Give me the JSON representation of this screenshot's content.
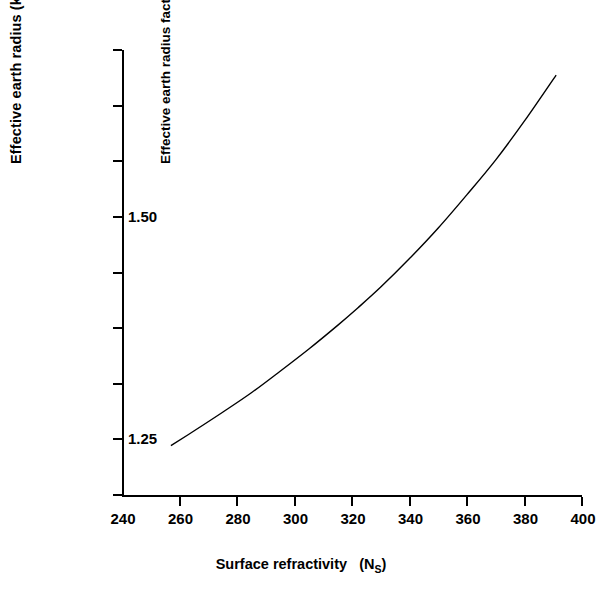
{
  "chart_data": {
    "type": "line",
    "title": "",
    "xlabel": "Surface refractivity  (N_S)",
    "xlabel_main": "Surface refractivity",
    "xlabel_paren_open": "(N",
    "xlabel_sub": "S",
    "xlabel_paren_close": ")",
    "ylabel": "Effective earth radius (km)",
    "ylabel_secondary": "Effective earth radius factor",
    "xlim": [
      240,
      400
    ],
    "ylim": [
      7600,
      10800
    ],
    "xticks": [
      240,
      260,
      280,
      300,
      320,
      340,
      360,
      380,
      400
    ],
    "xtick_labels": [
      "240",
      "260",
      "280",
      "300",
      "320",
      "340",
      "360",
      "380",
      "400"
    ],
    "yticks": [
      7600,
      8000,
      8400,
      8800,
      9200,
      9600,
      10000,
      10400,
      10800
    ],
    "ytick_labels": [
      "7600",
      "8000",
      "8400",
      "8800",
      "9200",
      "9600",
      "10000",
      "10400",
      "10800"
    ],
    "y2ticks": [
      8000,
      9600
    ],
    "y2tick_labels": [
      "1.25",
      "1.50"
    ],
    "grid": false,
    "legend": null,
    "series": [
      {
        "name": "effective earth radius",
        "x": [
          257,
          265,
          275,
          285,
          295,
          305,
          315,
          322,
          330,
          340,
          350,
          360,
          370,
          380,
          391
        ],
        "y": [
          7955,
          8060,
          8195,
          8335,
          8490,
          8650,
          8820,
          8945,
          9095,
          9300,
          9520,
          9760,
          10010,
          10290,
          10620
        ]
      }
    ],
    "line_color": "#000000",
    "line_width": 1.4
  }
}
